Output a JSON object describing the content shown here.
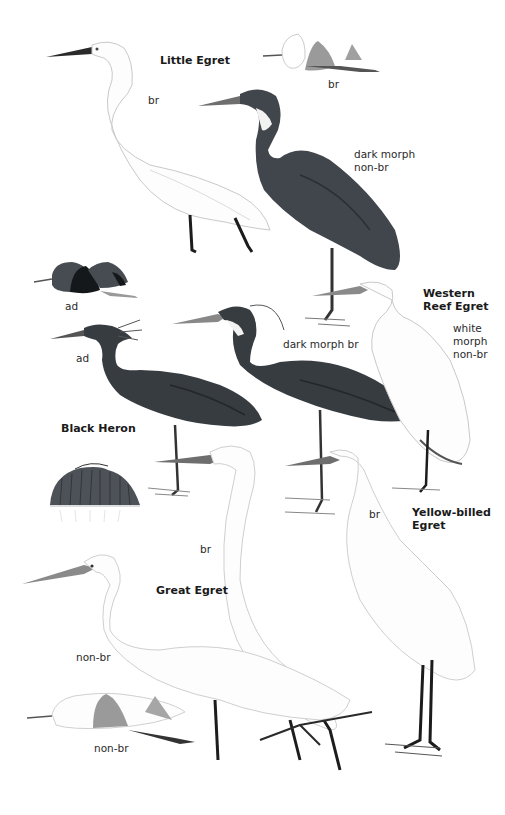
{
  "plate": {
    "species": [
      {
        "name": "Little Egret",
        "labels": [
          "br",
          "br",
          "dark morph\nnon-br"
        ]
      },
      {
        "name": "Western\nReef Egret",
        "labels": [
          "dark morph br",
          "white\nmorph\nnon-br"
        ]
      },
      {
        "name": "Black Heron",
        "labels": [
          "ad",
          "ad"
        ]
      },
      {
        "name": "Yellow-billed\nEgret",
        "labels": [
          "br"
        ]
      },
      {
        "name": "Great Egret",
        "labels": [
          "br",
          "non-br",
          "non-br"
        ]
      }
    ]
  },
  "labels": {
    "little_egret_title": "Little Egret",
    "little_egret_br": "br",
    "little_egret_flight_br": "br",
    "little_egret_dark_morph": "dark morph\nnon-br",
    "black_heron_flight_ad": "ad",
    "black_heron_ad": "ad",
    "black_heron_title": "Black Heron",
    "reef_egret_title": "Western\nReef Egret",
    "reef_egret_dark_br": "dark morph br",
    "reef_egret_white": "white\nmorph\nnon-br",
    "yellow_billed_title": "Yellow-billed\nEgret",
    "yellow_billed_br": "br",
    "great_egret_br": "br",
    "great_egret_title": "Great Egret",
    "great_egret_nonbr": "non-br",
    "great_egret_flight_nonbr": "non-br"
  },
  "colors": {
    "background": "#ffffff",
    "dark_plumage": "#3a3f44",
    "dark_plumage_shade": "#2b2f33",
    "white_plumage_line": "#c9c9c9",
    "wing_grey": "#8a8a8a",
    "leg_black": "#1c1c1c",
    "bill_grey": "#6e6e6e"
  }
}
